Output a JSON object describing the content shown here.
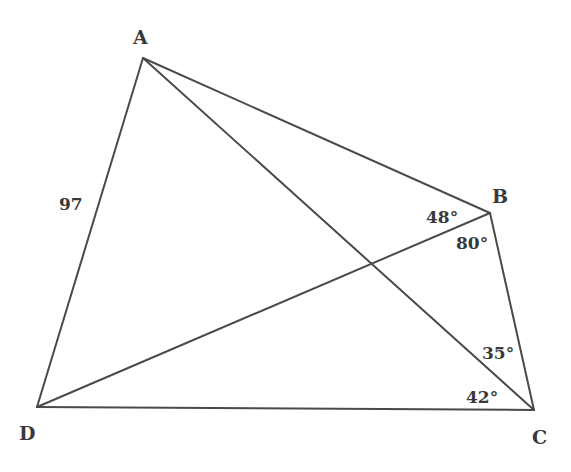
{
  "diagram": {
    "type": "quadrilateral-with-diagonals",
    "line_color": "#4a4a4a",
    "text_color": "#3a3a3a",
    "vertices": {
      "A": {
        "label": "A",
        "x": 143,
        "y": 58,
        "label_x": 133,
        "label_y": 44
      },
      "B": {
        "label": "B",
        "x": 490,
        "y": 213,
        "label_x": 492,
        "label_y": 203
      },
      "C": {
        "label": "C",
        "x": 534,
        "y": 410,
        "label_x": 532,
        "label_y": 444
      },
      "D": {
        "label": "D",
        "x": 37,
        "y": 407,
        "label_x": 19,
        "label_y": 440
      }
    },
    "edges": [
      {
        "from": "A",
        "to": "B"
      },
      {
        "from": "B",
        "to": "C"
      },
      {
        "from": "C",
        "to": "D"
      },
      {
        "from": "D",
        "to": "A"
      },
      {
        "from": "A",
        "to": "C"
      },
      {
        "from": "B",
        "to": "D"
      }
    ],
    "side_labels": [
      {
        "side": "AD",
        "text": "97",
        "x": 59,
        "y": 210
      }
    ],
    "angle_labels": [
      {
        "vertex": "B",
        "between": "AB-BD",
        "text": "48°",
        "x": 426,
        "y": 223
      },
      {
        "vertex": "B",
        "between": "BD-BC",
        "text": "80°",
        "x": 456,
        "y": 249
      },
      {
        "vertex": "C",
        "between": "BC-AC",
        "text": "35°",
        "x": 482,
        "y": 359
      },
      {
        "vertex": "C",
        "between": "AC-DC",
        "text": "42°",
        "x": 466,
        "y": 403
      }
    ]
  }
}
